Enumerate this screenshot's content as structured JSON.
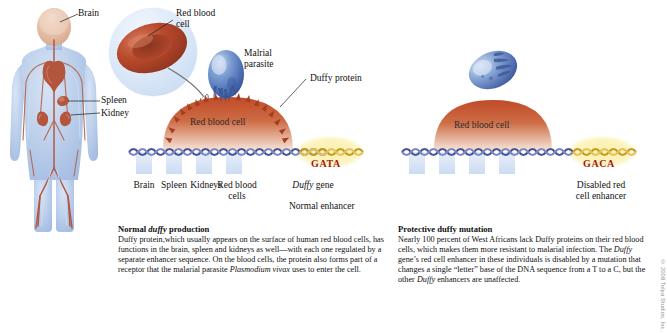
{
  "figure": {
    "background": "#ffffff"
  },
  "labels": {
    "brain": "Brain",
    "spleen": "Spleen",
    "kidney": "Kidney",
    "red_blood_cell_callout": "Red blood\ncell",
    "malarial_parasite": "Malrial\nparasite",
    "duffy_protein": "Duffy protein",
    "red_blood_cell_left": "Red blood cell",
    "red_blood_cell_right": "Red blood cell"
  },
  "left_panel": {
    "gene_track_labels": [
      "Brain",
      "Spleen",
      "Kidneys",
      "Red blood\ncells",
      "Duffy gene"
    ],
    "gene_label_italic_part": "Duffy",
    "gene_label_rest": " gene",
    "enhancer_sequence": "GATA",
    "enhancer_caption": "Normal enhancer"
  },
  "right_panel": {
    "enhancer_sequence": "GACA",
    "enhancer_caption": "Disabled red\ncell enhancer"
  },
  "captions": {
    "left": {
      "heading_pre": "Normal ",
      "heading_italic": "duffy",
      "heading_post": " production",
      "body_1": "Duffy protein,which usually appears on the surface of human red blood cells, has functions in the brain, spleen and kidneys as well—with each one regulated by a separate enhancer sequence. On the blood cells, the protein also forms part of a receptor that the malarial parasite ",
      "body_italic": "Plasmodium vivax",
      "body_2": " uses to enter the cell."
    },
    "right": {
      "heading": "Protective duffy mutation",
      "body_1": "Nearly 100 percent of West Africans lack Duffy proteins on their red blood cells, which makes them more resistant to malarial infection. The ",
      "body_italic_1": "Duffy",
      "body_2": " gene’s red cell enhancer in these individuals is disabled by a mutation that changes a single “letter” base of the DNA sequence from a T to a C, but the other ",
      "body_italic_2": "Duffy",
      "body_3": " enhancers are unaffected."
    }
  },
  "credit": "© 2008 Tolpa Studios, Inc.",
  "colors": {
    "body_blue": "#b9cdea",
    "vessel_red": "#b05a46",
    "rbc_red": "#b8472a",
    "parasite_blue": "#5b7fc0",
    "dna_blue": "#4a5596",
    "dna_gold": "#c79b1e",
    "highlight_yellow": "#f7e9a0",
    "sequence_red": "#a01818",
    "band_blue": "#dde6f6"
  }
}
